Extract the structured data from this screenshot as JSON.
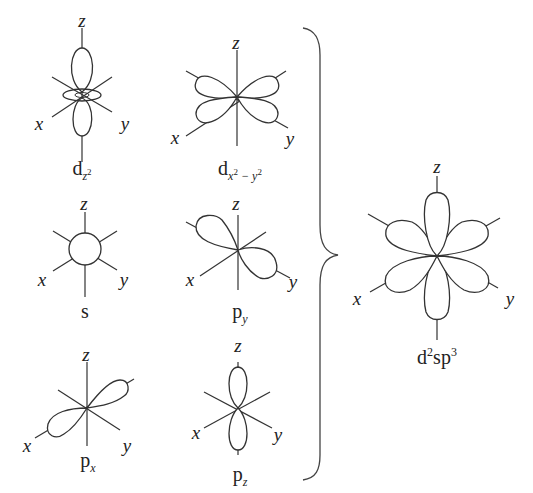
{
  "diagram": {
    "axis_labels": {
      "x": "x",
      "y": "y",
      "z": "z"
    },
    "orbitals": [
      {
        "id": "dz2",
        "base": "d",
        "sub": "z",
        "sub_sup": "2",
        "cx": 80,
        "cy": 95
      },
      {
        "id": "dx2y2",
        "base": "d",
        "sub": "x",
        "sub_sup": "2",
        "sub2": " − y",
        "sub2_sup": "2",
        "cx": 237,
        "cy": 97
      },
      {
        "id": "s",
        "base": "s",
        "cx": 85,
        "cy": 248
      },
      {
        "id": "py",
        "base": "p",
        "sub": "y",
        "cx": 238,
        "cy": 250
      },
      {
        "id": "px",
        "base": "p",
        "sub": "x",
        "cx": 87,
        "cy": 408
      },
      {
        "id": "pz",
        "base": "p",
        "sub": "z",
        "cx": 238,
        "cy": 408
      }
    ],
    "result": {
      "id": "d2sp3",
      "base": "d",
      "sup1": "2",
      "mid": "sp",
      "sup2": "3",
      "cx": 437,
      "cy": 256
    },
    "labels": {
      "dz2": {
        "base": "d",
        "sub": "z",
        "sup": "2"
      },
      "dx2y2": {
        "base": "d",
        "sub_a": "x",
        "sup_a": "2",
        "sub_b": " − y",
        "sup_b": "2"
      },
      "s": {
        "base": "s"
      },
      "py": {
        "base": "p",
        "sub": "y"
      },
      "px": {
        "base": "p",
        "sub": "x"
      },
      "pz": {
        "base": "p",
        "sub": "z"
      },
      "d2sp3": {
        "base": "d",
        "sup1": "2",
        "mid": "sp",
        "sup2": "3"
      }
    },
    "colors": {
      "line": "#333333",
      "background": "#ffffff",
      "text": "#222222"
    }
  }
}
